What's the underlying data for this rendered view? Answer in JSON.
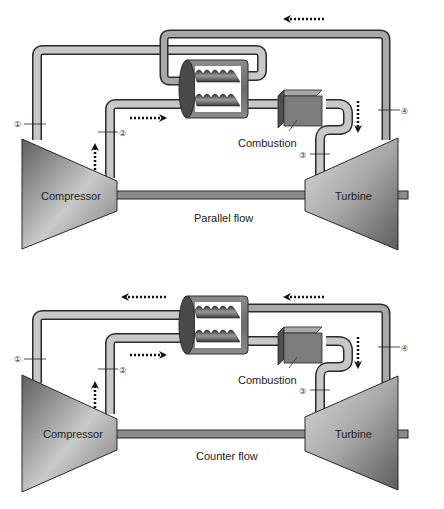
{
  "diagrams": [
    {
      "caption": "Parallel flow",
      "compressor_label": "Compressor",
      "turbine_label": "Turbine",
      "combustion_label": "Combustion",
      "stations": [
        "①",
        "②",
        "③",
        "④"
      ]
    },
    {
      "caption": "Counter flow",
      "compressor_label": "Compressor",
      "turbine_label": "Turbine",
      "combustion_label": "Combustion",
      "stations": [
        "①",
        "②",
        "③",
        "④"
      ]
    }
  ],
  "colors": {
    "pipe_fill": "#c8c8c8",
    "pipe_stroke": "#2a2a2a",
    "shaft": "#8a8a8a",
    "machine_dark": "#6e6e6e",
    "machine_light": "#d4d4d4",
    "box": "#7c7c7c",
    "arrow": "#111111"
  }
}
